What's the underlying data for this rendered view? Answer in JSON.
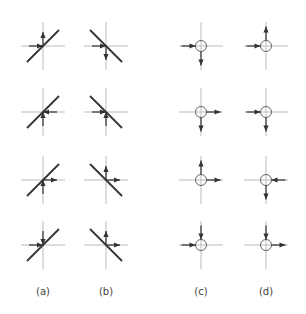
{
  "figure": {
    "columns": [
      {
        "id": "a",
        "label": "(a)",
        "cx": 43,
        "type": "line",
        "slope": "positive"
      },
      {
        "id": "b",
        "label": "(b)",
        "cx": 106,
        "type": "line",
        "slope": "negative"
      },
      {
        "id": "c",
        "label": "(c)",
        "cx": 201,
        "type": "circle"
      },
      {
        "id": "d",
        "label": "(d)",
        "cx": 266,
        "type": "circle"
      }
    ],
    "rows_y": [
      46,
      112,
      180,
      245
    ],
    "label_y": 293,
    "cells": {
      "a": [
        {
          "h": "in-from-left",
          "v": "out-up"
        },
        {
          "h": "in-from-right",
          "v": "in-from-below"
        },
        {
          "h": "out-right",
          "v": "in-from-below"
        },
        {
          "h": "in-from-left",
          "v": "in-from-above"
        }
      ],
      "b": [
        {
          "h": "in-from-left",
          "v": "out-down"
        },
        {
          "h": "in-from-left",
          "v": "in-from-below"
        },
        {
          "h": "out-right",
          "v": "out-up"
        },
        {
          "h": "out-right",
          "v": "out-up"
        }
      ],
      "c": [
        {
          "h": "in-from-left",
          "v": "out-down"
        },
        {
          "h": "out-right",
          "v": "out-down"
        },
        {
          "h": "out-right",
          "v": "out-up"
        },
        {
          "h": "in-from-left",
          "v": "in-from-above"
        }
      ],
      "d": [
        {
          "h": "in-from-left",
          "v": "out-up"
        },
        {
          "h": "in-from-left",
          "v": "out-down"
        },
        {
          "h": "in-from-right",
          "v": "out-down"
        },
        {
          "h": "out-right",
          "v": "in-from-above"
        }
      ]
    },
    "colors": {
      "axis": "#bbbbbb",
      "line": "#333333",
      "arrow": "#333333",
      "circle": "#555555",
      "label": "#444444"
    }
  }
}
